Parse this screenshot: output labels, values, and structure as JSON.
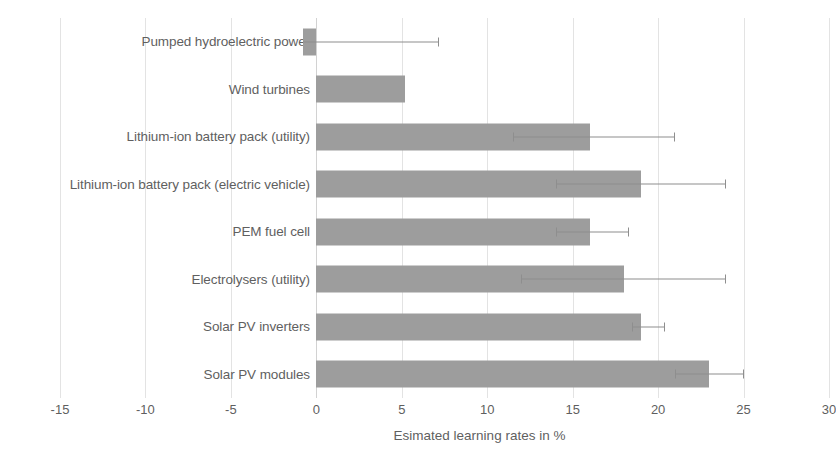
{
  "chart_data": {
    "type": "bar",
    "orientation": "horizontal",
    "title": "",
    "xlabel": "Esimated learning rates in %",
    "ylabel": "",
    "xlim": [
      -15,
      30
    ],
    "xticks": [
      -15,
      -10,
      -5,
      0,
      5,
      10,
      15,
      20,
      25,
      30
    ],
    "grid": true,
    "legend": false,
    "bar_color": "#9d9d9d",
    "error_bar_color": "#8e8e8e",
    "categories": [
      "Pumped hydroelectric power",
      "Wind turbines",
      "Lithium-ion battery pack (utility)",
      "Lithium-ion battery pack (electric vehicle)",
      "PEM fuel cell",
      "Electrolysers (utility)",
      "Solar PV inverters",
      "Solar PV modules"
    ],
    "values": [
      -0.8,
      5.2,
      16.0,
      19.0,
      16.0,
      18.0,
      19.0,
      23.0
    ],
    "error_low": [
      null,
      null,
      11.5,
      14.0,
      14.0,
      12.0,
      18.5,
      21.0
    ],
    "error_high": [
      7.2,
      null,
      21.0,
      24.0,
      18.3,
      24.0,
      20.4,
      25.0
    ]
  }
}
